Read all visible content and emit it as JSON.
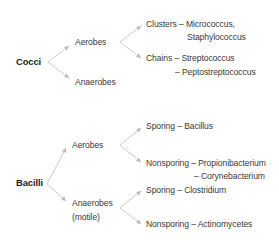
{
  "diagram": {
    "cocci": {
      "label": "Cocci",
      "aerobes": {
        "label": "Aerobes",
        "clusters": {
          "line1": "Clusters – Micrococcus,",
          "line2": "Staphylococcus"
        },
        "chains": {
          "line1": "Chains – Streptococcus",
          "line2": "– Peptostreptococcus"
        }
      },
      "anaerobes": {
        "label": "Anaerobes"
      }
    },
    "bacilli": {
      "label": "Bacilli",
      "aerobes": {
        "label": "Aerobes",
        "sporing": "Sporing – Bacillus",
        "nonsporing": {
          "line1": "Nonsporing – Propionibacterium",
          "line2": "– Corynebacterium"
        }
      },
      "anaerobes": {
        "label_line1": "Anaerobes",
        "label_line2": "(motile)",
        "sporing": "Sporing – Clostridium",
        "nonsporing": "Nonsporing – Actinomycetes"
      }
    }
  }
}
